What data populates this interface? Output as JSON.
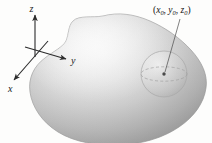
{
  "figure": {
    "name": "solid-region-with-interior-sphere",
    "background_color": "#fdfdfc",
    "axes": {
      "x_label": "x",
      "y_label": "y",
      "z_label": "z",
      "axis_color": "#2b2b2b",
      "origin": {
        "x": 35,
        "y": 52
      }
    },
    "point": {
      "open_paren": "(",
      "close_paren": ")",
      "x_var": "x",
      "x_sub": "0",
      "sep1": ", ",
      "y_var": "y",
      "y_sub": "0",
      "sep2": ", ",
      "z_var": "z",
      "z_sub": "0",
      "full_text": "(x0, y0, z0)",
      "marker_color": "#555555"
    },
    "solid": {
      "fill_light": "#f2f2f2",
      "fill_mid": "#c9c9c9",
      "fill_dark": "#9a9a9a",
      "outline_color": "#9c9c9c"
    },
    "sphere": {
      "outline_color": "#a8a8a8",
      "equator_color": "#9d9d9d",
      "center_dot_color": "#4a4a4a"
    },
    "leader_line": {
      "color": "#4a4a4a"
    }
  }
}
